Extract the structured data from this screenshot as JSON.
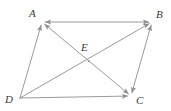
{
  "figure": {
    "width": 171,
    "height": 111,
    "background_color": "#ffffff",
    "stroke_color": "#9a9a9a",
    "label_color": "#3a3a3a",
    "stroke_width": 1
  },
  "points": {
    "A": {
      "label": "A",
      "x": 42,
      "y": 22,
      "label_x": 29,
      "label_y": 8
    },
    "B": {
      "label": "B",
      "x": 152,
      "y": 22,
      "label_x": 156,
      "label_y": 9
    },
    "C": {
      "label": "C",
      "x": 131,
      "y": 96,
      "label_x": 136,
      "label_y": 95
    },
    "D": {
      "label": "D",
      "x": 20,
      "y": 98,
      "label_x": 5,
      "label_y": 94
    },
    "E": {
      "label": "E",
      "x": 89,
      "y": 61,
      "label_x": 81,
      "label_y": 42
    }
  },
  "segments": [
    {
      "name": "side-AB",
      "from": "A",
      "to": "B",
      "arrow_start": true,
      "arrow_end": true
    },
    {
      "name": "side-BC",
      "from": "B",
      "to": "C",
      "arrow_start": true,
      "arrow_end": true
    },
    {
      "name": "side-DC",
      "from": "D",
      "to": "C",
      "arrow_start": false,
      "arrow_end": true
    },
    {
      "name": "side-AD",
      "from": "A",
      "to": "D",
      "arrow_start": true,
      "arrow_end": false
    },
    {
      "name": "diagonal-AC",
      "from": "A",
      "to": "C",
      "arrow_start": true,
      "arrow_end": true
    },
    {
      "name": "diagonal-DB",
      "from": "D",
      "to": "B",
      "arrow_start": false,
      "arrow_end": true
    }
  ],
  "annotations": {
    "intersection_marker": "E"
  }
}
